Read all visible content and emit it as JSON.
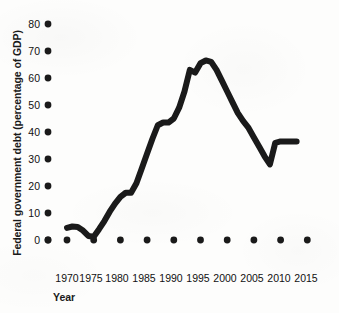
{
  "figure": {
    "background_color": "#fdfdfc",
    "ink_color": "#1a1a1a"
  },
  "axes": {
    "y_title": "Federal government debt (percentage of GDP)",
    "x_title": "Year",
    "y_tick_labels": [
      "80",
      "70",
      "60",
      "50",
      "40",
      "30",
      "20",
      "10",
      "0"
    ],
    "x_tick_labels": [
      "1970",
      "1975",
      "1980",
      "1985",
      "1990",
      "1995",
      "2000",
      "2005",
      "2010",
      "2015"
    ]
  },
  "chart_data": {
    "type": "line",
    "title": "",
    "xlabel": "Year",
    "ylabel": "Federal government debt (percentage of GDP)",
    "xlim": [
      1968,
      2017
    ],
    "ylim": [
      0,
      80
    ],
    "xticks": [
      1970,
      1975,
      1980,
      1985,
      1990,
      1995,
      2000,
      2005,
      2010,
      2015
    ],
    "yticks": [
      0,
      10,
      20,
      30,
      40,
      50,
      60,
      70,
      80
    ],
    "grid": false,
    "legend": null,
    "tick_style": "round-dot-markers",
    "line_color": "#1a1a1a",
    "line_width_px": 6,
    "series": [
      {
        "name": "Federal government debt (percentage of GDP)",
        "x": [
          1970,
          1971,
          1972,
          1973,
          1974,
          1975,
          1976,
          1977,
          1978,
          1979,
          1980,
          1981,
          1982,
          1983,
          1984,
          1985,
          1986,
          1987,
          1988,
          1989,
          1990,
          1991,
          1992,
          1993,
          1994,
          1995,
          1996,
          1997,
          1998,
          1999,
          2000,
          2001,
          2002,
          2003,
          2004,
          2005,
          2006,
          2007,
          2008,
          2009,
          2010,
          2011,
          2012,
          2013
        ],
        "values": [
          4.5,
          5.0,
          4.8,
          3.5,
          1.5,
          1.2,
          4.0,
          7.0,
          10.5,
          13.5,
          16.0,
          17.5,
          17.5,
          21.0,
          26.5,
          32.0,
          37.5,
          42.5,
          43.5,
          43.5,
          45.0,
          49.0,
          55.0,
          63.0,
          62.0,
          65.5,
          66.5,
          66.0,
          63.0,
          59.0,
          55.0,
          51.0,
          47.0,
          44.0,
          41.5,
          38.0,
          34.5,
          31.0,
          28.0,
          36.0,
          36.5,
          36.5,
          36.5,
          36.5
        ]
      }
    ]
  }
}
